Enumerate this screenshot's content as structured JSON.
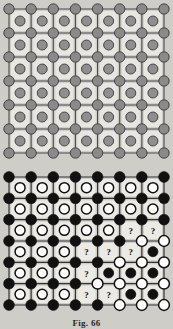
{
  "document": {
    "caption": "Fig. 66",
    "background_color": "#cfcdc8"
  },
  "figures": [
    {
      "id": "top-lattice",
      "name": "ionic-lattice-uniform",
      "description": "Square lattice of gray vertex ions joined by bonds, with a gray interstitial ion centered in every cell",
      "rows": 6,
      "cols": 7,
      "vertex_rows": 7,
      "vertex_cols": 8,
      "vertex_color": "#8a8a8a",
      "vertex_stroke": "#3a3a3a",
      "cell_fill": "#e8e6e1",
      "cell_ion_color": "#8f8f8f",
      "cell_ion_stroke": "#3a3a3a",
      "bond_color": "#4a4a4a",
      "cells": [
        [
          "g",
          "g",
          "g",
          "g",
          "g",
          "g",
          "g"
        ],
        [
          "g",
          "g",
          "g",
          "g",
          "g",
          "g",
          "g"
        ],
        [
          "g",
          "g",
          "g",
          "g",
          "g",
          "g",
          "g"
        ],
        [
          "g",
          "g",
          "g",
          "g",
          "g",
          "g",
          "g"
        ],
        [
          "g",
          "g",
          "g",
          "g",
          "g",
          "g",
          "g"
        ],
        [
          "g",
          "g",
          "g",
          "g",
          "g",
          "g",
          "g"
        ]
      ],
      "vertices": [
        [
          "g",
          "g",
          "g",
          "g",
          "g",
          "g",
          "g",
          "g"
        ],
        [
          "g",
          "g",
          "g",
          "g",
          "g",
          "g",
          "g",
          "g"
        ],
        [
          "g",
          "g",
          "g",
          "g",
          "g",
          "g",
          "g",
          "g"
        ],
        [
          "g",
          "g",
          "g",
          "g",
          "g",
          "g",
          "g",
          "g"
        ],
        [
          "g",
          "g",
          "g",
          "g",
          "g",
          "g",
          "g",
          "g"
        ],
        [
          "g",
          "g",
          "g",
          "g",
          "g",
          "g",
          "g",
          "g"
        ],
        [
          "g",
          "g",
          "g",
          "g",
          "g",
          "g",
          "g",
          "g"
        ]
      ]
    },
    {
      "id": "bottom-lattice",
      "name": "ionic-lattice-domain-boundary",
      "description": "Square lattice showing a domain boundary: upper-left region has black vertex ions with open interstitial circles, lower-right region has open vertex circles with black interstitial ions, and question marks mark the ambiguous transition cells",
      "rows": 6,
      "cols": 7,
      "vertex_rows": 7,
      "vertex_cols": 8,
      "filled_color": "#111111",
      "open_fill": "#ffffff",
      "open_stroke": "#111111",
      "cell_fill": "#eceae5",
      "bond_color": "#333333",
      "question_mark": "?",
      "legend": {
        "filled_symbol": "●",
        "open_symbol": "○",
        "unknown_symbol": "?"
      },
      "cells": [
        [
          "o",
          "o",
          "o",
          "o",
          "o",
          "o",
          "o"
        ],
        [
          "o",
          "o",
          "o",
          "o",
          "o",
          "o",
          "o"
        ],
        [
          "o",
          "o",
          "o",
          "o",
          "o",
          "q",
          "q"
        ],
        [
          "o",
          "o",
          "o",
          "q",
          "q",
          "q",
          "f"
        ],
        [
          "o",
          "o",
          "o",
          "q",
          "f",
          "f",
          "f"
        ],
        [
          "o",
          "o",
          "o",
          "q",
          "q",
          "f",
          "f"
        ]
      ],
      "vertices": [
        [
          "f",
          "f",
          "f",
          "f",
          "f",
          "f",
          "f",
          "f"
        ],
        [
          "f",
          "f",
          "f",
          "f",
          "f",
          "f",
          "f",
          "f"
        ],
        [
          "f",
          "f",
          "f",
          "f",
          "f",
          "f",
          "f",
          "f"
        ],
        [
          "f",
          "f",
          "f",
          "f",
          "f",
          "f",
          "o",
          "o"
        ],
        [
          "f",
          "f",
          "f",
          "f",
          "f",
          "o",
          "o",
          "o"
        ],
        [
          "f",
          "f",
          "f",
          "f",
          "o",
          "o",
          "o",
          "o"
        ],
        [
          "f",
          "f",
          "f",
          "f",
          "f",
          "o",
          "o",
          "o"
        ]
      ]
    }
  ]
}
